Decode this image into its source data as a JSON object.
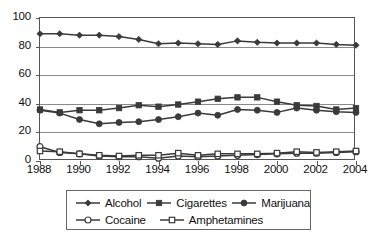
{
  "chart_data": {
    "type": "line",
    "title": "",
    "subtitle": "",
    "xlabel": "",
    "ylabel": "",
    "xlim": [
      1988,
      2004
    ],
    "ylim": [
      0,
      100
    ],
    "grid": true,
    "legend_position": "bottom",
    "yticks": [
      0,
      20,
      40,
      60,
      80,
      100
    ],
    "ytick_labels": [
      "0",
      "20",
      "40",
      "60",
      "80",
      "100"
    ],
    "x": [
      1988,
      1989,
      1990,
      1991,
      1992,
      1993,
      1994,
      1995,
      1996,
      1997,
      1998,
      1999,
      2000,
      2001,
      2002,
      2003,
      2004
    ],
    "xtick_values": [
      1988,
      1990,
      1992,
      1994,
      1996,
      1998,
      2000,
      2002,
      2004
    ],
    "xtick_labels": [
      "1988",
      "1990",
      "1992",
      "1994",
      "1996",
      "1998",
      "2000",
      "2002",
      "2004"
    ],
    "series": [
      {
        "name": "Alcohol",
        "marker": "filled-diamond",
        "color": "#3a3a3a",
        "values": [
          89,
          89,
          88,
          88,
          87,
          85,
          82,
          82.5,
          82,
          81.5,
          84,
          83,
          82.5,
          82.5,
          82.5,
          81.5,
          81
        ]
      },
      {
        "name": "Cigarettes",
        "marker": "filled-square",
        "color": "#3a3a3a",
        "values": [
          36,
          34,
          35.5,
          35.5,
          37,
          39,
          38,
          39.5,
          41.5,
          43.5,
          44.5,
          44.5,
          41.5,
          39,
          38.5,
          36,
          37
        ]
      },
      {
        "name": "Marijuana",
        "marker": "filled-circle",
        "color": "#3a3a3a",
        "values": [
          35.5,
          33.5,
          29,
          26,
          27,
          27.5,
          29,
          31,
          33.5,
          32,
          36,
          35.5,
          34,
          37,
          35.5,
          34.5,
          34
        ]
      },
      {
        "name": "Cocaine",
        "marker": "open-circle",
        "color": "#3a3a3a",
        "values": [
          10,
          6,
          5,
          3.5,
          3,
          3,
          2,
          3.5,
          3,
          3.5,
          4,
          4.5,
          5,
          5.5,
          5.5,
          6,
          6.5
        ]
      },
      {
        "name": "Amphetamines",
        "marker": "open-square",
        "color": "#3a3a3a",
        "values": [
          7,
          6.5,
          5,
          4,
          3.5,
          4,
          4,
          5.5,
          4,
          5,
          5,
          5,
          5.5,
          6.5,
          6,
          6.5,
          7
        ]
      }
    ]
  },
  "legend": {
    "rows": [
      [
        {
          "label": "Alcohol",
          "marker": "filled-diamond"
        },
        {
          "label": "Cigarettes",
          "marker": "filled-square"
        },
        {
          "label": "Marijuana",
          "marker": "filled-circle"
        }
      ],
      [
        {
          "label": "Cocaine",
          "marker": "open-circle"
        },
        {
          "label": "Amphetamines",
          "marker": "open-square"
        }
      ]
    ]
  },
  "colors": {
    "line": "#3a3a3a",
    "frame": "#555555",
    "grid": "#8a8a8a",
    "text": "#111111",
    "background": "#ffffff"
  }
}
